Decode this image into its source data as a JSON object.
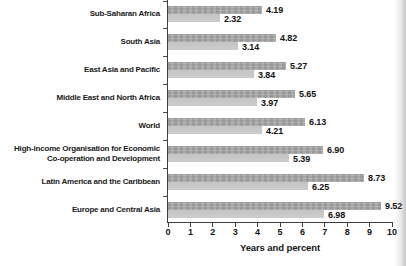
{
  "chart_data": {
    "type": "bar",
    "orientation": "horizontal",
    "title": "",
    "xlabel": "Years and percent",
    "ylabel": "",
    "xlim": [
      0,
      10
    ],
    "xticks": [
      "0",
      "1",
      "2",
      "3",
      "4",
      "5",
      "6",
      "7",
      "8",
      "9",
      "10"
    ],
    "grid": false,
    "legend": "none",
    "categories": [
      "Sub-Saharan Africa",
      "South Asia",
      "East Asia and Pacific",
      "Middle East and North Africa",
      "World",
      "High-income Organisation for Economic Co-operation and Development",
      "Latin America and the Caribbean",
      "Europe and Central Asia"
    ],
    "category_label_lines": [
      [
        "Sub-Saharan Africa"
      ],
      [
        "South Asia"
      ],
      [
        "East Asia and Pacific"
      ],
      [
        "Middle East and North Africa"
      ],
      [
        "World"
      ],
      [
        "High-income Organisation for Economic",
        "Co-operation and Development"
      ],
      [
        "Latin America and the Caribbean"
      ],
      [
        "Europe and Central Asia"
      ]
    ],
    "series": [
      {
        "name": "upper",
        "color": "#a7a7a7",
        "values": [
          4.19,
          4.82,
          5.27,
          5.65,
          6.13,
          6.9,
          8.73,
          9.52
        ]
      },
      {
        "name": "lower",
        "color": "#c8c8c8",
        "values": [
          2.32,
          3.14,
          3.84,
          3.97,
          4.21,
          5.39,
          6.25,
          6.98
        ]
      }
    ],
    "value_labels": {
      "upper": [
        "4.19",
        "4.82",
        "5.27",
        "5.65",
        "6.13",
        "6.90",
        "8.73",
        "9.52"
      ],
      "lower": [
        "2.32",
        "3.14",
        "3.84",
        "3.97",
        "4.21",
        "5.39",
        "6.25",
        "6.98"
      ]
    },
    "colors": {
      "upper_bar": "#a7a7a7",
      "lower_bar": "#c8c8c8",
      "axis": "#3d3d3d",
      "text": "#141414",
      "background": "#ffffff"
    }
  }
}
